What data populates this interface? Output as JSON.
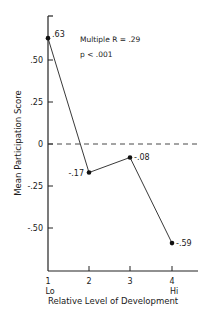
{
  "chart_data": {
    "type": "line",
    "title": "",
    "xlabel": "Relative Level of Development",
    "ylabel": "Mean Participation Score",
    "categories": [
      "1",
      "2",
      "3",
      "4"
    ],
    "category_sublabels": [
      "Lo",
      "",
      "",
      "Hi"
    ],
    "series": [
      {
        "name": "Mean Participation Score",
        "values": [
          0.63,
          -0.17,
          -0.08,
          -0.59
        ]
      }
    ],
    "data_labels": [
      ".63",
      "-.17",
      "-.08",
      "-.59"
    ],
    "y_ticks": [
      ".50",
      ".25",
      "0",
      "-.25",
      "-.50"
    ],
    "y_tick_values": [
      0.5,
      0.25,
      0,
      -0.25,
      -0.5
    ],
    "ylim": [
      -0.75,
      0.7
    ],
    "reference_line": {
      "y": 0,
      "style": "dashed"
    },
    "annotations": [
      "Multiple R = .29",
      "p < .001"
    ],
    "grid": false,
    "legend": "none"
  }
}
